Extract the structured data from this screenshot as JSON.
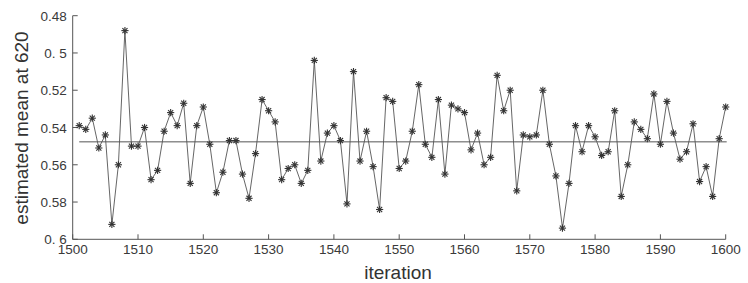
{
  "chart_data": {
    "type": "line",
    "title": "",
    "xlabel": "iteration",
    "ylabel": "estimated mean at 620",
    "xlim": [
      1500,
      1600
    ],
    "ylim": [
      0.6,
      0.48
    ],
    "y_inverted": true,
    "grid": false,
    "legend": null,
    "x_ticks": [
      1500,
      1510,
      1520,
      1530,
      1540,
      1550,
      1560,
      1570,
      1580,
      1590,
      1600
    ],
    "x_tick_labels": [
      "1500",
      "1510",
      "1520",
      "1530",
      "1540",
      "1550",
      "1560",
      "1570",
      "1580",
      "1590",
      "1600"
    ],
    "y_ticks": [
      0.48,
      0.5,
      0.52,
      0.54,
      0.56,
      0.58,
      0.6
    ],
    "y_tick_labels": [
      "0.48",
      "0. 5",
      "0.52",
      "0.54",
      "0.56",
      "0.58",
      "0. 6"
    ],
    "marker": "asterisk",
    "series": [
      {
        "name": "estimate",
        "x_start": 1501,
        "values": [
          0.539,
          0.541,
          0.535,
          0.551,
          0.544,
          0.592,
          0.56,
          0.488,
          0.55,
          0.55,
          0.54,
          0.568,
          0.563,
          0.542,
          0.532,
          0.539,
          0.527,
          0.57,
          0.539,
          0.529,
          0.549,
          0.575,
          0.564,
          0.547,
          0.547,
          0.565,
          0.578,
          0.554,
          0.525,
          0.531,
          0.537,
          0.568,
          0.562,
          0.56,
          0.57,
          0.563,
          0.504,
          0.558,
          0.543,
          0.539,
          0.547,
          0.581,
          0.51,
          0.558,
          0.542,
          0.561,
          0.584,
          0.524,
          0.526,
          0.562,
          0.558,
          0.542,
          0.517,
          0.549,
          0.556,
          0.525,
          0.565,
          0.528,
          0.53,
          0.532,
          0.552,
          0.543,
          0.56,
          0.556,
          0.512,
          0.531,
          0.52,
          0.574,
          0.544,
          0.545,
          0.544,
          0.52,
          0.549,
          0.566,
          0.594,
          0.57,
          0.539,
          0.553,
          0.539,
          0.545,
          0.555,
          0.553,
          0.531,
          0.577,
          0.56,
          0.537,
          0.541,
          0.546,
          0.522,
          0.549,
          0.526,
          0.543,
          0.557,
          0.553,
          0.538,
          0.569,
          0.561,
          0.577,
          0.546,
          0.529
        ]
      },
      {
        "name": "mean",
        "type": "hline",
        "value": 0.5477,
        "x_range": [
          1501,
          1600
        ]
      }
    ]
  },
  "colors": {
    "line": "#555555",
    "marker": "#333333",
    "axis": "#555555",
    "background": "#ffffff"
  }
}
